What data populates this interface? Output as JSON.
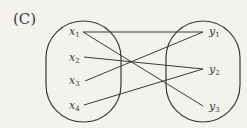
{
  "panel_label": "(C)",
  "domain_set": {
    "name": "X",
    "elements": [
      {
        "base": "x",
        "sub": "1"
      },
      {
        "base": "x",
        "sub": "2"
      },
      {
        "base": "x",
        "sub": "3"
      },
      {
        "base": "x",
        "sub": "4"
      }
    ]
  },
  "codomain_set": {
    "name": "Y",
    "elements": [
      {
        "base": "y",
        "sub": "1"
      },
      {
        "base": "y",
        "sub": "2"
      },
      {
        "base": "y",
        "sub": "3"
      }
    ]
  },
  "mappings": [
    {
      "from": "x1",
      "to": "y1"
    },
    {
      "from": "x1",
      "to": "y3"
    },
    {
      "from": "x2",
      "to": "y2"
    },
    {
      "from": "x3",
      "to": "y1"
    },
    {
      "from": "x4",
      "to": "y2"
    }
  ]
}
